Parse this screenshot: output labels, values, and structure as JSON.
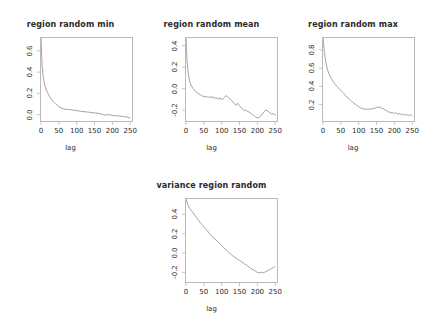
{
  "figure": {
    "background": "#ffffff",
    "line_color": "#8c8c8c",
    "axis_color": "#b9b9b9",
    "text_color": "#2b2b2b",
    "xlabel": "lag"
  },
  "chart_data": [
    {
      "type": "line",
      "id": "region-random-min",
      "title": "region random min",
      "xlabel": "lag",
      "ylabel": "",
      "xlim": [
        0,
        255
      ],
      "ylim": [
        -0.06,
        0.72
      ],
      "xticks": [
        0,
        50,
        100,
        150,
        200,
        250
      ],
      "xticklabels": [
        "0",
        "50",
        "100",
        "150",
        "200",
        "250"
      ],
      "yticks": [
        0.0,
        0.2,
        0.4,
        0.6
      ],
      "yticklabels": [
        "0.0",
        "0.2",
        "0.4",
        "0.6"
      ],
      "grid": false,
      "legend": "none",
      "x": [
        0,
        3,
        6,
        9,
        12,
        15,
        18,
        21,
        25,
        30,
        35,
        40,
        45,
        50,
        55,
        60,
        65,
        70,
        75,
        80,
        85,
        90,
        95,
        100,
        110,
        120,
        130,
        140,
        150,
        160,
        170,
        175,
        180,
        190,
        200,
        210,
        215,
        220,
        230,
        240,
        250
      ],
      "y": [
        0.72,
        0.47,
        0.36,
        0.3,
        0.26,
        0.23,
        0.21,
        0.19,
        0.165,
        0.14,
        0.12,
        0.105,
        0.09,
        0.075,
        0.065,
        0.058,
        0.052,
        0.05,
        0.05,
        0.048,
        0.045,
        0.042,
        0.04,
        0.038,
        0.032,
        0.028,
        0.024,
        0.02,
        0.016,
        0.012,
        0.005,
        0.0,
        -0.004,
        0.0,
        -0.006,
        -0.012,
        -0.01,
        -0.013,
        -0.018,
        -0.022,
        -0.032
      ]
    },
    {
      "type": "line",
      "id": "region-random-mean",
      "title": "region random mean",
      "xlabel": "lag",
      "ylabel": "",
      "xlim": [
        0,
        255
      ],
      "ylim": [
        -0.3,
        0.47
      ],
      "xticks": [
        0,
        50,
        100,
        150,
        200,
        250
      ],
      "xticklabels": [
        "0",
        "50",
        "100",
        "150",
        "200",
        "250"
      ],
      "yticks": [
        -0.2,
        0.0,
        0.2,
        0.4
      ],
      "yticklabels": [
        "-0.2",
        "0.0",
        "0.2",
        "0.4"
      ],
      "grid": false,
      "legend": "none",
      "x": [
        0,
        3,
        6,
        9,
        12,
        16,
        20,
        24,
        28,
        32,
        36,
        40,
        44,
        48,
        52,
        56,
        60,
        64,
        68,
        72,
        76,
        80,
        84,
        88,
        92,
        96,
        100,
        104,
        108,
        112,
        116,
        120,
        124,
        128,
        132,
        136,
        140,
        144,
        148,
        152,
        156,
        160,
        164,
        168,
        172,
        176,
        180,
        184,
        188,
        192,
        196,
        200,
        204,
        208,
        212,
        216,
        220,
        224,
        228,
        232,
        236,
        240,
        244,
        248,
        252
      ],
      "y": [
        0.47,
        0.26,
        0.15,
        0.09,
        0.05,
        0.02,
        0.0,
        -0.015,
        -0.03,
        -0.04,
        -0.05,
        -0.055,
        -0.065,
        -0.07,
        -0.078,
        -0.07,
        -0.08,
        -0.075,
        -0.085,
        -0.07,
        -0.09,
        -0.078,
        -0.095,
        -0.082,
        -0.1,
        -0.085,
        -0.105,
        -0.09,
        -0.08,
        -0.065,
        -0.072,
        -0.085,
        -0.098,
        -0.11,
        -0.125,
        -0.14,
        -0.155,
        -0.135,
        -0.15,
        -0.165,
        -0.18,
        -0.195,
        -0.205,
        -0.2,
        -0.21,
        -0.215,
        -0.225,
        -0.235,
        -0.245,
        -0.255,
        -0.265,
        -0.27,
        -0.268,
        -0.26,
        -0.245,
        -0.225,
        -0.21,
        -0.2,
        -0.205,
        -0.215,
        -0.228,
        -0.235,
        -0.232,
        -0.24,
        -0.245
      ]
    },
    {
      "type": "line",
      "id": "region-random-max",
      "title": "region random max",
      "xlabel": "lag",
      "ylabel": "",
      "xlim": [
        0,
        255
      ],
      "ylim": [
        0.02,
        0.93
      ],
      "xticks": [
        0,
        50,
        100,
        150,
        200,
        250
      ],
      "xticklabels": [
        "0",
        "50",
        "100",
        "150",
        "200",
        "250"
      ],
      "yticks": [
        0.2,
        0.4,
        0.6,
        0.8
      ],
      "yticklabels": [
        "0.2",
        "0.4",
        "0.6",
        "0.8"
      ],
      "grid": false,
      "legend": "none",
      "x": [
        0,
        4,
        8,
        12,
        16,
        20,
        25,
        30,
        35,
        40,
        45,
        50,
        55,
        60,
        65,
        70,
        75,
        80,
        85,
        90,
        95,
        100,
        105,
        110,
        115,
        120,
        125,
        130,
        135,
        140,
        145,
        150,
        155,
        160,
        165,
        170,
        175,
        180,
        185,
        190,
        195,
        200,
        205,
        210,
        215,
        220,
        225,
        230,
        235,
        240,
        245,
        250
      ],
      "y": [
        0.93,
        0.77,
        0.66,
        0.59,
        0.545,
        0.51,
        0.475,
        0.445,
        0.42,
        0.395,
        0.375,
        0.355,
        0.335,
        0.315,
        0.29,
        0.275,
        0.255,
        0.235,
        0.22,
        0.205,
        0.19,
        0.175,
        0.165,
        0.155,
        0.152,
        0.15,
        0.148,
        0.15,
        0.152,
        0.155,
        0.16,
        0.168,
        0.172,
        0.168,
        0.16,
        0.15,
        0.14,
        0.13,
        0.118,
        0.108,
        0.118,
        0.098,
        0.112,
        0.09,
        0.105,
        0.085,
        0.1,
        0.08,
        0.095,
        0.078,
        0.092,
        0.075
      ]
    },
    {
      "type": "line",
      "id": "variance-region-random",
      "title": "variance region random",
      "xlabel": "lag",
      "ylabel": "",
      "xlim": [
        0,
        255
      ],
      "ylim": [
        -0.3,
        0.56
      ],
      "xticks": [
        0,
        50,
        100,
        150,
        200,
        250
      ],
      "xticklabels": [
        "0",
        "50",
        "100",
        "150",
        "200",
        "250"
      ],
      "yticks": [
        -0.2,
        0.0,
        0.2,
        0.4
      ],
      "yticklabels": [
        "-0.2",
        "0.0",
        "0.2",
        "0.4"
      ],
      "grid": false,
      "legend": "none",
      "x": [
        0,
        5,
        10,
        15,
        20,
        25,
        30,
        35,
        40,
        45,
        50,
        55,
        60,
        65,
        70,
        75,
        80,
        85,
        90,
        95,
        100,
        105,
        110,
        115,
        120,
        125,
        130,
        135,
        140,
        145,
        150,
        155,
        160,
        165,
        170,
        175,
        180,
        185,
        190,
        195,
        200,
        205,
        210,
        215,
        220,
        225,
        230,
        235,
        240,
        245,
        250
      ],
      "y": [
        0.56,
        0.5,
        0.465,
        0.44,
        0.415,
        0.39,
        0.365,
        0.34,
        0.315,
        0.295,
        0.27,
        0.25,
        0.23,
        0.205,
        0.185,
        0.165,
        0.145,
        0.135,
        0.115,
        0.095,
        0.08,
        0.06,
        0.04,
        0.025,
        0.005,
        -0.01,
        -0.025,
        -0.04,
        -0.05,
        -0.065,
        -0.075,
        -0.09,
        -0.1,
        -0.115,
        -0.125,
        -0.14,
        -0.155,
        -0.17,
        -0.175,
        -0.19,
        -0.2,
        -0.205,
        -0.198,
        -0.205,
        -0.2,
        -0.19,
        -0.18,
        -0.17,
        -0.16,
        -0.15,
        -0.135
      ]
    }
  ]
}
